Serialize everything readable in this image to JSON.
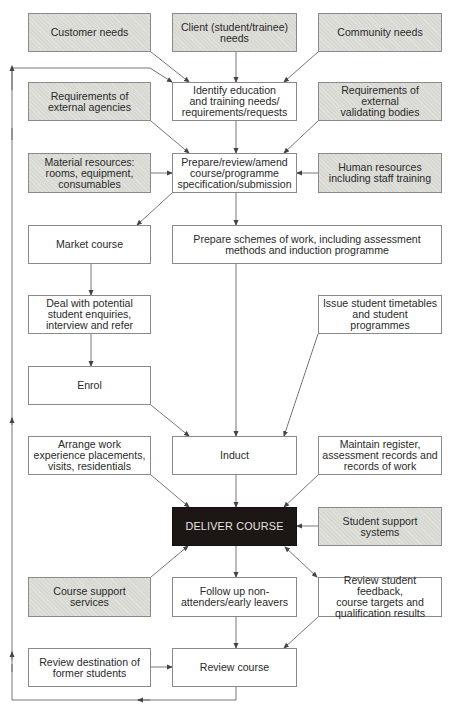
{
  "diagram": {
    "type": "flowchart",
    "nodes": {
      "customer_needs": {
        "label": "Customer needs",
        "style": "shaded"
      },
      "client_needs": {
        "label": "Client (student/trainee)\nneeds",
        "style": "shaded"
      },
      "community_needs": {
        "label": "Community needs",
        "style": "shaded"
      },
      "req_external_agencies": {
        "label": "Requirements of\nexternal agencies",
        "style": "shaded"
      },
      "identify_needs": {
        "label": "Identify education\nand training needs/\nrequirements/requests",
        "style": "plain"
      },
      "req_validating_bodies": {
        "label": "Requirements of external\nvalidating bodies",
        "style": "shaded"
      },
      "material_resources": {
        "label": "Material resources:\nrooms, equipment,\nconsumables",
        "style": "shaded"
      },
      "prepare_spec": {
        "label": "Prepare/review/amend\ncourse/programme\nspecification/submission",
        "style": "plain"
      },
      "human_resources": {
        "label": "Human resources\nincluding staff training",
        "style": "shaded"
      },
      "market_course": {
        "label": "Market course",
        "style": "plain"
      },
      "prepare_schemes": {
        "label": "Prepare schemes of work, including assessment\nmethods and induction programme",
        "style": "plain"
      },
      "deal_enquiries": {
        "label": "Deal with potential\nstudent enquiries,\ninterview and refer",
        "style": "plain"
      },
      "issue_timetables": {
        "label": "Issue student timetables\nand student\nprogrammes",
        "style": "plain"
      },
      "enrol": {
        "label": "Enrol",
        "style": "plain"
      },
      "arrange_work": {
        "label": "Arrange work\nexperience placements,\nvisits, residentials",
        "style": "plain"
      },
      "induct": {
        "label": "Induct",
        "style": "plain"
      },
      "maintain_register": {
        "label": "Maintain register,\nassessment records and\nrecords of work",
        "style": "plain"
      },
      "deliver_course": {
        "label": "DELIVER COURSE",
        "style": "dark"
      },
      "student_support": {
        "label": "Student support systems",
        "style": "shaded"
      },
      "course_support": {
        "label": "Course support\nservices",
        "style": "shaded"
      },
      "follow_up": {
        "label": "Follow up non-\nattenders/early leavers",
        "style": "plain"
      },
      "review_feedback": {
        "label": "Review student feedback,\ncourse targets and\nqualification results",
        "style": "plain"
      },
      "review_destination": {
        "label": "Review destination of\nformer students",
        "style": "plain"
      },
      "review_course": {
        "label": "Review course",
        "style": "plain"
      }
    },
    "edges": [
      {
        "from": "customer_needs",
        "to": "identify_needs"
      },
      {
        "from": "client_needs",
        "to": "identify_needs"
      },
      {
        "from": "community_needs",
        "to": "identify_needs"
      },
      {
        "from": "req_external_agencies",
        "to": "prepare_spec"
      },
      {
        "from": "identify_needs",
        "to": "prepare_spec"
      },
      {
        "from": "req_validating_bodies",
        "to": "prepare_spec"
      },
      {
        "from": "material_resources",
        "to": "prepare_spec"
      },
      {
        "from": "human_resources",
        "to": "prepare_spec"
      },
      {
        "from": "prepare_spec",
        "to": "market_course"
      },
      {
        "from": "prepare_spec",
        "to": "prepare_schemes"
      },
      {
        "from": "market_course",
        "to": "deal_enquiries"
      },
      {
        "from": "deal_enquiries",
        "to": "enrol"
      },
      {
        "from": "enrol",
        "to": "induct"
      },
      {
        "from": "prepare_schemes",
        "to": "induct"
      },
      {
        "from": "issue_timetables",
        "to": "induct"
      },
      {
        "from": "arrange_work",
        "to": "deliver_course"
      },
      {
        "from": "induct",
        "to": "deliver_course"
      },
      {
        "from": "maintain_register",
        "to": "deliver_course"
      },
      {
        "from": "student_support",
        "to": "deliver_course"
      },
      {
        "from": "course_support",
        "to": "deliver_course"
      },
      {
        "from": "deliver_course",
        "to": "follow_up"
      },
      {
        "from": "deliver_course",
        "to": "review_feedback",
        "bidirectional": true
      },
      {
        "from": "follow_up",
        "to": "review_course"
      },
      {
        "from": "review_feedback",
        "to": "review_course"
      },
      {
        "from": "review_destination",
        "to": "review_course"
      },
      {
        "from": "review_course",
        "to": "identify_needs",
        "type": "feedback-loop"
      }
    ]
  }
}
